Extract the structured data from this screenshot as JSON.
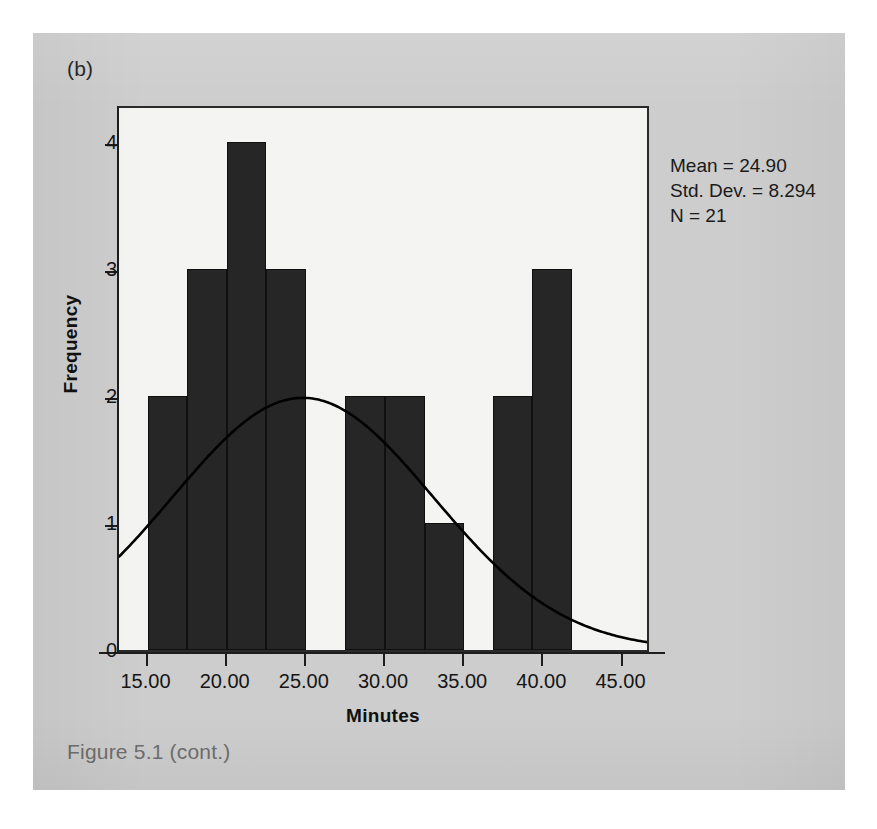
{
  "page": {
    "panel_label": "(b)",
    "caption": "Figure 5.1  (cont.)",
    "card_color": "#cdcdcd",
    "page_color": "#ffffff"
  },
  "stats": {
    "mean_line": "Mean = 24.90",
    "std_dev_line": "Std. Dev. = 8.294",
    "n_line": "N = 21"
  },
  "chart_data": {
    "type": "bar",
    "title": "",
    "subtitle": "",
    "xlabel": "Minutes",
    "ylabel": "Frequency",
    "xlim": [
      13.2,
      46.8
    ],
    "ylim": [
      0,
      4.3
    ],
    "grid": false,
    "legend_position": "none",
    "bar_color": "#262626",
    "curve_color": "#000000",
    "plot_background": "#f4f4f2",
    "x_ticks": [
      15,
      20,
      25,
      30,
      35,
      40,
      45
    ],
    "x_tick_labels": [
      "15.00",
      "20.00",
      "25.00",
      "30.00",
      "35.00",
      "40.00",
      "45.00"
    ],
    "y_ticks": [
      0,
      1,
      2,
      3,
      4
    ],
    "y_tick_labels": [
      "0",
      "1",
      "2",
      "3",
      "4"
    ],
    "bin_width": 2.5,
    "bins": [
      {
        "start": 15.0,
        "end": 17.5,
        "value": 2
      },
      {
        "start": 17.5,
        "end": 20.0,
        "value": 3
      },
      {
        "start": 20.0,
        "end": 22.5,
        "value": 4
      },
      {
        "start": 22.5,
        "end": 25.0,
        "value": 3
      },
      {
        "start": 25.0,
        "end": 27.5,
        "value": 0
      },
      {
        "start": 27.5,
        "end": 30.0,
        "value": 2
      },
      {
        "start": 30.0,
        "end": 32.5,
        "value": 2
      },
      {
        "start": 32.5,
        "end": 35.0,
        "value": 1
      },
      {
        "start": 35.0,
        "end": 37.5,
        "value": 0
      },
      {
        "start": 37.5,
        "end": 40.0,
        "value": 1
      },
      {
        "start": 40.0,
        "end": 42.5,
        "value": 0
      },
      {
        "start": 42.5,
        "end": 45.0,
        "value": 0
      }
    ],
    "categories": [
      "15.0-17.5",
      "17.5-20.0",
      "20.0-22.5",
      "22.5-25.0",
      "25.0-27.5",
      "27.5-30.0",
      "30.0-32.5",
      "32.5-35.0",
      "35.0-37.5",
      "37.5-40.0",
      "40.0-42.5",
      "42.5-45.0"
    ],
    "values": [
      2,
      3,
      4,
      3,
      0,
      2,
      2,
      1,
      0,
      1,
      0,
      0
    ],
    "extra_bars": [
      {
        "start": 36.8,
        "end": 39.3,
        "value": 2,
        "note": "bar near 37-39"
      },
      {
        "start": 39.3,
        "end": 41.8,
        "value": 3,
        "note": "tall bar near 40"
      }
    ],
    "normal_curve": {
      "shown": true,
      "mean": 24.9,
      "std_dev": 8.294,
      "n": 21,
      "scale_note": "density scaled so peak height = 2.0 frequency units"
    },
    "annotations": [
      "Mean = 24.90",
      "Std. Dev. = 8.294",
      "N = 21"
    ]
  }
}
